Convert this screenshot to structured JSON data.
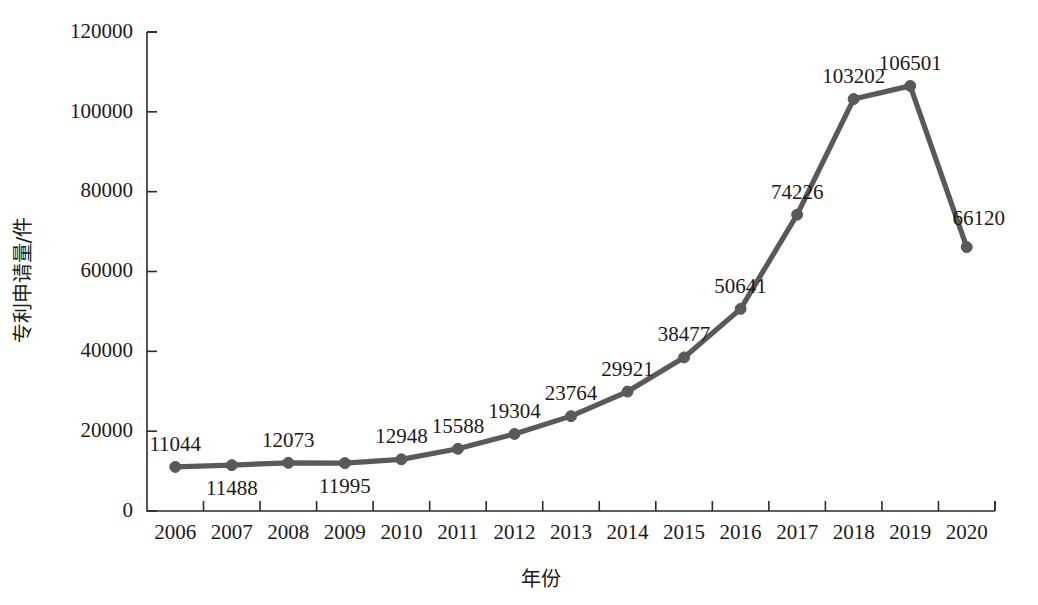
{
  "chart_data": {
    "type": "line",
    "title": "",
    "xlabel": "年份",
    "ylabel": "专利申请量/件",
    "categories": [
      "2006",
      "2007",
      "2008",
      "2009",
      "2010",
      "2011",
      "2012",
      "2013",
      "2014",
      "2015",
      "2016",
      "2017",
      "2018",
      "2019",
      "2020"
    ],
    "values": [
      11044,
      11488,
      12073,
      11995,
      12948,
      15588,
      19304,
      23764,
      29921,
      38477,
      50641,
      74226,
      103202,
      106501,
      66120
    ],
    "point_labels": [
      "11044",
      "11488",
      "12073",
      "11995",
      "12948",
      "15588",
      "19304",
      "23764",
      "29921",
      "38477",
      "50641",
      "74226",
      "103202",
      "106501",
      "66120"
    ],
    "label_positions": [
      "above",
      "below",
      "above",
      "below",
      "above",
      "above",
      "above",
      "above",
      "above",
      "above",
      "above",
      "above",
      "above",
      "above",
      "right"
    ],
    "ylim": [
      0,
      120000
    ],
    "ytick_labels": [
      "0",
      "20000",
      "40000",
      "60000",
      "80000",
      "100000",
      "120000"
    ],
    "yticks": [
      0,
      20000,
      40000,
      60000,
      80000,
      100000,
      120000
    ],
    "grid": false,
    "legend": "none",
    "series_color": "#595959",
    "axis_color": "#2b2b2b",
    "text_color": "#1a1a1a",
    "background": "#ffffff",
    "marker": "circle",
    "marker_size": 11
  }
}
